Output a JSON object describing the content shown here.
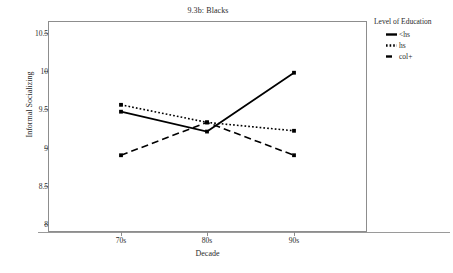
{
  "chart_data": {
    "type": "line",
    "title": "9.3b: Blacks",
    "xlabel": "Decade",
    "ylabel": "Informal Socializing",
    "categories": [
      "70s",
      "80s",
      "90s"
    ],
    "ylim": [
      8,
      10.5
    ],
    "yticks": [
      "8",
      "8.5",
      "9",
      "9.5",
      "10",
      "10.5"
    ],
    "ytick_values": [
      8,
      8.5,
      9,
      9.5,
      10,
      10.5
    ],
    "grid": false,
    "legend_position": "right",
    "legend_title": "Level of Education",
    "series": [
      {
        "name": "<hs",
        "style": "solid",
        "color": "#000000",
        "values": [
          9.47,
          9.21,
          9.98
        ]
      },
      {
        "name": "hs",
        "style": "dotted",
        "color": "#000000",
        "values": [
          9.56,
          9.33,
          9.22
        ]
      },
      {
        "name": "col+",
        "style": "dashed",
        "color": "#000000",
        "values": [
          8.9,
          9.33,
          8.9
        ]
      }
    ]
  },
  "axis": {
    "y_tick_labels": [
      "10.5",
      "10",
      "9.5",
      "9",
      "8.5",
      "8"
    ],
    "x_tick_labels": [
      "70s",
      "80s",
      "90s"
    ]
  },
  "legend": {
    "title": "Level of Education",
    "items": [
      {
        "label": "<hs"
      },
      {
        "label": "hs"
      },
      {
        "label": "col+"
      }
    ]
  }
}
